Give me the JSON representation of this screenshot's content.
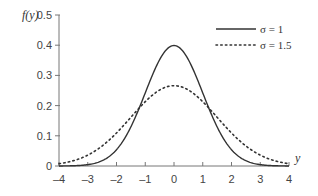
{
  "chart_data": {
    "type": "line",
    "title": "",
    "xlabel": "y",
    "ylabel": "f(y)",
    "xlim": [
      -4,
      4
    ],
    "ylim": [
      0,
      0.5
    ],
    "xticks": [
      -4,
      -3,
      -2,
      -1,
      0,
      1,
      2,
      3,
      4
    ],
    "yticks": [
      0,
      0.1,
      0.2,
      0.3,
      0.4,
      0.5
    ],
    "ytick_labels": [
      "0",
      "0.1",
      "0.2",
      "0.3",
      "0.4",
      "0.5"
    ],
    "grid": false,
    "legend_position": "upper right",
    "series": [
      {
        "name": "σ = 1",
        "style": "solid",
        "mean": 0,
        "sigma": 1,
        "peak": 0.399
      },
      {
        "name": "σ = 1.5",
        "style": "dotted",
        "mean": 0,
        "sigma": 1.5,
        "peak": 0.266
      }
    ]
  },
  "labels": {
    "ylabel": "f(y)",
    "xlabel": "y",
    "legend": [
      "σ = 1",
      "σ = 1.5"
    ]
  }
}
